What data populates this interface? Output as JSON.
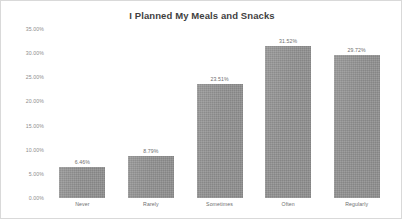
{
  "chart_data": {
    "type": "bar",
    "title": "I Planned My Meals and Snacks",
    "xlabel": "",
    "ylabel": "",
    "categories": [
      "Never",
      "Rarely",
      "Sometimes",
      "Often",
      "Regularly"
    ],
    "values": [
      6.46,
      8.79,
      23.51,
      31.52,
      29.72
    ],
    "value_labels": [
      "6.46%",
      "8.79%",
      "23.51%",
      "31.52%",
      "29.72%"
    ],
    "ylim": [
      0,
      35
    ],
    "ytick_values": [
      35,
      30,
      25,
      20,
      15,
      10,
      5,
      0
    ],
    "ytick_labels": [
      "35.00%",
      "30.00%",
      "25.00%",
      "20.00%",
      "15.00%",
      "10.00%",
      "5.00%",
      "0.00%"
    ],
    "grid": false,
    "legend": "none",
    "series": [
      {
        "name": "I Planned My Meals and Snacks",
        "values": [
          6.46,
          8.79,
          23.51,
          31.52,
          29.72
        ]
      }
    ],
    "colors": {
      "bar": "#989898",
      "background": "#ffffff",
      "border": "#d9d9d9",
      "title_text": "#3f3f3f",
      "axis_text": "#8d8d8d",
      "label_text": "#6e6e6e"
    }
  }
}
